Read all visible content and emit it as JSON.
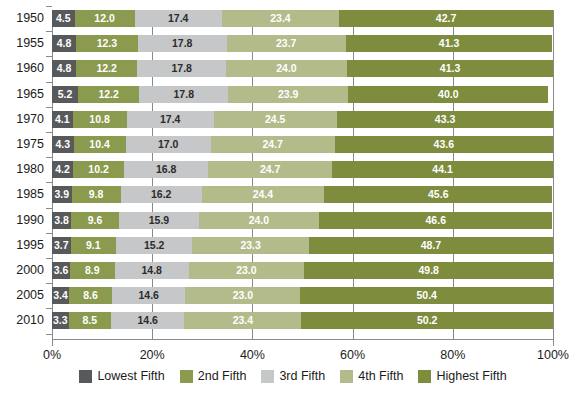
{
  "chart_data": {
    "type": "bar",
    "orientation": "horizontal",
    "stacked": true,
    "stack_mode": "percent",
    "title": "",
    "subtitle": "",
    "xlabel": "",
    "ylabel": "",
    "xlim": [
      0,
      100
    ],
    "xticks": [
      0,
      20,
      40,
      60,
      80,
      100
    ],
    "xtick_labels": [
      "0%",
      "20%",
      "40%",
      "60%",
      "80%",
      "100%"
    ],
    "grid": true,
    "grid_axis": "x",
    "legend_position": "bottom",
    "categories": [
      "1950",
      "1955",
      "1960",
      "1965",
      "1970",
      "1975",
      "1980",
      "1985",
      "1990",
      "1995",
      "2000",
      "2005",
      "2010"
    ],
    "series": [
      {
        "name": "Lowest Fifth",
        "color": "#58595b",
        "label_color": "#ffffff",
        "values": [
          4.5,
          4.8,
          4.8,
          5.2,
          4.1,
          4.3,
          4.2,
          3.9,
          3.8,
          3.7,
          3.6,
          3.4,
          3.3
        ]
      },
      {
        "name": "2nd Fifth",
        "color": "#8a9a4e",
        "label_color": "#ffffff",
        "values": [
          12.0,
          12.3,
          12.2,
          12.2,
          10.8,
          10.4,
          10.2,
          9.8,
          9.6,
          9.1,
          8.9,
          8.6,
          8.5
        ]
      },
      {
        "name": "3rd Fifth",
        "color": "#c6c7c8",
        "label_color": "#2b2b2b",
        "values": [
          17.4,
          17.8,
          17.8,
          17.8,
          17.4,
          17.0,
          16.8,
          16.2,
          15.9,
          15.2,
          14.8,
          14.6,
          14.6
        ]
      },
      {
        "name": "4th Fifth",
        "color": "#b3bb8b",
        "label_color": "#ffffff",
        "values": [
          23.4,
          23.7,
          24.0,
          23.9,
          24.5,
          24.7,
          24.7,
          24.4,
          24.0,
          23.3,
          23.0,
          23.0,
          23.4
        ]
      },
      {
        "name": "Highest Fifth",
        "color": "#7d8c3d",
        "label_color": "#ffffff",
        "values": [
          42.7,
          41.3,
          41.3,
          40.0,
          43.3,
          43.6,
          44.1,
          45.6,
          46.6,
          48.7,
          49.8,
          50.4,
          50.2
        ]
      }
    ]
  },
  "legend": {
    "items": [
      {
        "label": "Lowest Fifth"
      },
      {
        "label": "2nd Fifth"
      },
      {
        "label": "3rd Fifth"
      },
      {
        "label": "4th Fifth"
      },
      {
        "label": "Highest Fifth"
      }
    ]
  },
  "axis": {
    "x_tick_labels": [
      "0%",
      "20%",
      "40%",
      "60%",
      "80%",
      "100%"
    ],
    "y_tick_labels": [
      "1950",
      "1955",
      "1960",
      "1965",
      "1970",
      "1975",
      "1980",
      "1985",
      "1990",
      "1995",
      "2000",
      "2005",
      "2010"
    ]
  },
  "colors": {
    "lowest_fifth": "#58595b",
    "second_fifth": "#8a9a4e",
    "third_fifth": "#c6c7c8",
    "fourth_fifth": "#b3bb8b",
    "highest_fifth": "#7d8c3d",
    "gridline": "#8a8a8a",
    "background": "#ffffff",
    "text": "#1b1b1b"
  }
}
